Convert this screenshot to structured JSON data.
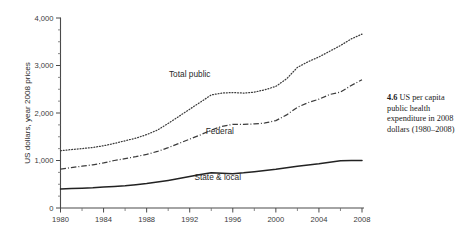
{
  "figure": {
    "caption_number": "4.6",
    "caption_text": "US per capita public health expenditure in 2008 dollars (1980–2008)"
  },
  "chart_data": {
    "type": "line",
    "title": "",
    "xlabel": "",
    "ylabel": "US dollars, year 2008 prices",
    "xlim": [
      1980,
      2008
    ],
    "ylim": [
      0,
      4000
    ],
    "grid": false,
    "legend": "inline-labels",
    "y_ticks": [
      0,
      1000,
      2000,
      3000,
      4000
    ],
    "y_ticklabels": [
      "0",
      "1,000",
      "2,000",
      "3,000",
      "4,000"
    ],
    "y_minor_step": 250,
    "x_ticks": [
      1980,
      1984,
      1988,
      1992,
      1996,
      2000,
      2004,
      2008
    ],
    "x_ticklabels": [
      "1980",
      "1984",
      "1988",
      "1992",
      "1996",
      "2000",
      "2004",
      "2008"
    ],
    "x_minor_step": 2,
    "x": [
      1980,
      1981,
      1982,
      1983,
      1984,
      1985,
      1986,
      1987,
      1988,
      1989,
      1990,
      1991,
      1992,
      1993,
      1994,
      1995,
      1996,
      1997,
      1998,
      1999,
      2000,
      2001,
      2002,
      2003,
      2004,
      2005,
      2006,
      2007,
      2008
    ],
    "series": [
      {
        "name": "Total public",
        "style": "dotted",
        "label_x": 1992.0,
        "label_y": 2760,
        "values": [
          1205,
          1230,
          1250,
          1275,
          1310,
          1360,
          1415,
          1470,
          1545,
          1640,
          1780,
          1930,
          2080,
          2230,
          2380,
          2420,
          2430,
          2420,
          2440,
          2490,
          2560,
          2720,
          2960,
          3080,
          3180,
          3300,
          3420,
          3560,
          3660
        ]
      },
      {
        "name": "Federal",
        "style": "dash-dot",
        "label_x": 1994.8,
        "label_y": 1560,
        "values": [
          820,
          850,
          880,
          910,
          950,
          1000,
          1040,
          1080,
          1130,
          1190,
          1270,
          1360,
          1450,
          1540,
          1640,
          1720,
          1760,
          1760,
          1770,
          1790,
          1840,
          1960,
          2120,
          2220,
          2290,
          2390,
          2440,
          2580,
          2700
        ]
      },
      {
        "name": "State & local",
        "style": "solid",
        "label_x": 1994.6,
        "label_y": 600,
        "values": [
          400,
          408,
          416,
          425,
          440,
          455,
          470,
          490,
          515,
          545,
          580,
          620,
          665,
          705,
          740,
          730,
          722,
          740,
          765,
          790,
          815,
          845,
          880,
          905,
          930,
          965,
          995,
          1000,
          1000
        ]
      }
    ]
  }
}
